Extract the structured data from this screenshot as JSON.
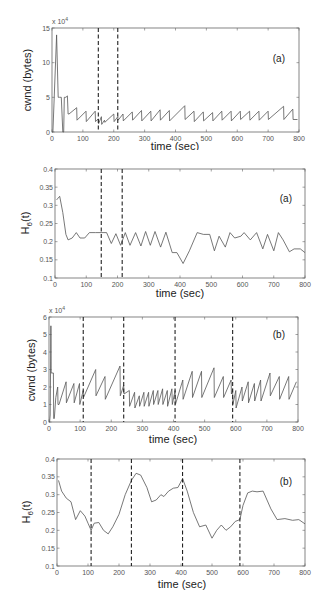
{
  "chart_data": [
    {
      "id": "a_cwnd",
      "type": "line",
      "panel_tag": "(a)",
      "title": "",
      "xlabel": "time (sec)",
      "ylabel": "cwnd (bytes)",
      "y_multiplier": "x 10^4",
      "xlim": [
        0,
        800
      ],
      "ylim": [
        0,
        15
      ],
      "xticks": [
        0,
        100,
        200,
        300,
        400,
        500,
        600,
        700,
        800
      ],
      "yticks": [
        0,
        5,
        10,
        15
      ],
      "grid": false,
      "markers_dashed_x": [
        150,
        213
      ],
      "series": [
        {
          "name": "cwnd",
          "x": [
            0,
            3,
            15,
            20,
            25,
            30,
            35,
            38,
            40,
            45,
            50,
            52,
            55,
            80,
            81,
            110,
            111,
            140,
            141,
            150,
            151,
            160,
            161,
            170,
            171,
            200,
            201,
            213,
            214,
            230,
            231,
            260,
            261,
            290,
            291,
            320,
            321,
            350,
            351,
            380,
            381,
            430,
            431,
            460,
            461,
            490,
            491,
            520,
            521,
            550,
            551,
            580,
            581,
            610,
            611,
            640,
            641,
            670,
            671,
            700,
            701,
            750,
            751,
            780,
            781,
            795
          ],
          "y": [
            0,
            0,
            14,
            5,
            5,
            5,
            0,
            0,
            5,
            5,
            5.2,
            2.6,
            2.6,
            3.5,
            1.7,
            3.0,
            1.5,
            3.0,
            1.5,
            1.9,
            1.2,
            2.2,
            1.1,
            1.7,
            1.4,
            2.6,
            1.5,
            2.2,
            1.7,
            2.6,
            1.6,
            2.9,
            1.7,
            3.1,
            1.6,
            3.0,
            1.6,
            3.2,
            1.7,
            3.1,
            1.6,
            3.8,
            1.8,
            3.0,
            1.5,
            2.9,
            1.6,
            2.8,
            1.6,
            3.0,
            1.7,
            3.0,
            1.6,
            3.0,
            1.8,
            3.0,
            1.7,
            3.0,
            1.7,
            3.0,
            1.8,
            3.7,
            1.8,
            3.3,
            1.8,
            1.8
          ]
        }
      ]
    },
    {
      "id": "a_h",
      "type": "line",
      "panel_tag": "(a)",
      "title": "",
      "xlabel": "time (sec)",
      "ylabel": "H6(t)",
      "ylabel_main": "H",
      "ylabel_sub": "6",
      "ylabel_tail": "(t)",
      "xlim": [
        0,
        800
      ],
      "ylim": [
        0.1,
        0.4
      ],
      "xticks": [
        0,
        100,
        200,
        300,
        400,
        500,
        600,
        700,
        800
      ],
      "yticks": [
        0.1,
        0.15,
        0.2,
        0.25,
        0.3,
        0.35,
        0.4
      ],
      "grid": false,
      "markers_dashed_x": [
        148,
        215
      ],
      "series": [
        {
          "name": "H6(t)",
          "x": [
            5,
            10,
            15,
            25,
            35,
            42,
            55,
            68,
            80,
            95,
            110,
            130,
            150,
            165,
            180,
            195,
            210,
            225,
            240,
            258,
            275,
            290,
            305,
            320,
            338,
            355,
            375,
            390,
            410,
            430,
            455,
            475,
            495,
            510,
            525,
            545,
            560,
            575,
            595,
            605,
            625,
            645,
            665,
            680,
            700,
            715,
            730,
            750,
            765,
            785,
            800
          ],
          "y": [
            0.315,
            0.32,
            0.325,
            0.28,
            0.22,
            0.205,
            0.21,
            0.225,
            0.21,
            0.21,
            0.225,
            0.225,
            0.225,
            0.225,
            0.195,
            0.222,
            0.19,
            0.225,
            0.19,
            0.225,
            0.188,
            0.228,
            0.19,
            0.228,
            0.185,
            0.226,
            0.17,
            0.17,
            0.14,
            0.175,
            0.225,
            0.22,
            0.22,
            0.175,
            0.215,
            0.185,
            0.225,
            0.21,
            0.215,
            0.225,
            0.205,
            0.225,
            0.18,
            0.22,
            0.175,
            0.225,
            0.205,
            0.172,
            0.18,
            0.18,
            0.17
          ]
        }
      ]
    },
    {
      "id": "b_cwnd",
      "type": "line",
      "panel_tag": "(b)",
      "title": "",
      "xlabel": "time (sec)",
      "ylabel": "cwnd (bytes)",
      "y_multiplier": "x 10^4",
      "xlim": [
        0,
        800
      ],
      "ylim": [
        0,
        6
      ],
      "xticks": [
        0,
        100,
        200,
        300,
        400,
        500,
        600,
        700,
        800
      ],
      "yticks": [
        0,
        1,
        2,
        3,
        4,
        5,
        6
      ],
      "grid": false,
      "markers_dashed_x": [
        110,
        240,
        405,
        590
      ],
      "series": [
        {
          "name": "cwnd",
          "x": [
            0,
            2,
            4,
            6,
            7,
            8,
            14,
            15,
            17,
            22,
            28,
            29,
            32,
            55,
            56,
            80,
            81,
            98,
            99,
            110,
            111,
            150,
            151,
            180,
            181,
            228,
            229,
            240,
            241,
            258,
            259,
            275,
            276,
            290,
            291,
            305,
            306,
            320,
            321,
            335,
            336,
            350,
            351,
            365,
            366,
            380,
            381,
            395,
            396,
            405,
            406,
            430,
            431,
            460,
            461,
            490,
            491,
            530,
            531,
            560,
            561,
            585,
            586,
            590,
            591,
            600,
            601,
            620,
            621,
            640,
            641,
            660,
            661,
            680,
            681,
            710,
            711,
            740,
            741,
            770,
            771,
            795
          ],
          "y": [
            0,
            0,
            0.4,
            5.5,
            2.8,
            2.8,
            2.8,
            0.2,
            0.2,
            1.4,
            2.0,
            1.0,
            1.0,
            2.3,
            1.1,
            2.2,
            1.1,
            2.2,
            1.0,
            1.8,
            1.4,
            3.0,
            1.5,
            2.6,
            1.3,
            3.2,
            1.5,
            2.1,
            1.6,
            1.8,
            0.9,
            1.7,
            0.8,
            1.5,
            0.9,
            1.7,
            0.9,
            1.7,
            0.9,
            1.8,
            1.0,
            1.8,
            1.0,
            1.9,
            1.0,
            1.8,
            0.9,
            1.9,
            1.0,
            1.8,
            1.0,
            2.4,
            1.3,
            2.9,
            1.4,
            2.9,
            1.4,
            3.1,
            1.4,
            2.6,
            1.4,
            2.4,
            1.6,
            1.9,
            1.0,
            1.8,
            0.8,
            2.0,
            1.2,
            2.3,
            1.1,
            2.2,
            1.2,
            2.4,
            1.2,
            2.8,
            1.5,
            2.6,
            1.3,
            2.6,
            1.3,
            2.3
          ]
        }
      ]
    },
    {
      "id": "b_h",
      "type": "line",
      "panel_tag": "(b)",
      "title": "",
      "xlabel": "time (sec)",
      "ylabel": "H6(t)",
      "ylabel_main": "H",
      "ylabel_sub": "6",
      "ylabel_tail": "(t)",
      "xlim": [
        0,
        800
      ],
      "ylim": [
        0.1,
        0.4
      ],
      "xticks": [
        0,
        100,
        200,
        300,
        400,
        500,
        600,
        700,
        800
      ],
      "yticks": [
        0.1,
        0.15,
        0.2,
        0.25,
        0.3,
        0.35,
        0.4
      ],
      "grid": false,
      "markers_dashed_x": [
        110,
        240,
        405,
        590
      ],
      "series": [
        {
          "name": "H6(t)",
          "x": [
            5,
            15,
            30,
            45,
            60,
            75,
            90,
            100,
            110,
            120,
            135,
            150,
            165,
            180,
            200,
            220,
            240,
            255,
            270,
            290,
            305,
            320,
            335,
            345,
            360,
            375,
            390,
            405,
            420,
            440,
            460,
            480,
            500,
            515,
            530,
            545,
            560,
            575,
            590,
            600,
            615,
            630,
            645,
            665,
            690,
            710,
            735,
            760,
            780,
            800
          ],
          "y": [
            0.34,
            0.31,
            0.29,
            0.28,
            0.23,
            0.255,
            0.24,
            0.22,
            0.2,
            0.22,
            0.222,
            0.2,
            0.19,
            0.21,
            0.245,
            0.3,
            0.34,
            0.36,
            0.355,
            0.32,
            0.28,
            0.285,
            0.3,
            0.295,
            0.31,
            0.318,
            0.32,
            0.345,
            0.31,
            0.25,
            0.21,
            0.215,
            0.178,
            0.2,
            0.215,
            0.2,
            0.21,
            0.225,
            0.23,
            0.27,
            0.305,
            0.31,
            0.308,
            0.31,
            0.26,
            0.23,
            0.233,
            0.228,
            0.23,
            0.218
          ]
        }
      ]
    }
  ],
  "panels": [
    {
      "tag": "(a)",
      "xlabel": "time (sec)",
      "ylabel": "cwnd (bytes)",
      "multiplier_base": "x 10",
      "multiplier_exp": "4"
    },
    {
      "tag": "(a)",
      "xlabel": "time (sec)",
      "ylabel_main": "H",
      "ylabel_sub": "6",
      "ylabel_tail": "(t)"
    },
    {
      "tag": "(b)",
      "xlabel": "time (sec)",
      "ylabel": "cwnd (bytes)",
      "multiplier_base": "x 10",
      "multiplier_exp": "4"
    },
    {
      "tag": "(b)",
      "xlabel": "time (sec)",
      "ylabel_main": "H",
      "ylabel_sub": "6",
      "ylabel_tail": "(t)"
    }
  ],
  "colors": {
    "line": "#555555",
    "axes": "#666666",
    "dashed": "#222222",
    "background": "#ffffff"
  }
}
